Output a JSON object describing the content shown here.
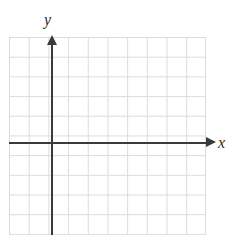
{
  "figure": {
    "type": "blank-coordinate-grid",
    "background_color": "#ffffff",
    "width": 231,
    "height": 235
  },
  "chart_data": {
    "type": "scatter",
    "title": "",
    "subtitle": "",
    "xlabel": "x",
    "ylabel": "y",
    "series": [],
    "x": [],
    "values": [],
    "annotations": [],
    "legend": [],
    "legend_position": "none",
    "grid": true,
    "grid_color": "#dcdcdc",
    "grid_cell_size_px": 19.7,
    "grid_columns": 10,
    "grid_rows": 10,
    "axis_color": "#3a3a3a",
    "xlim": [
      -2.2,
      7.8
    ],
    "ylim": [
      -4.7,
      5.3
    ],
    "xticklabels": [],
    "yticklabels": [],
    "origin_px": {
      "x": 52,
      "y": 143
    },
    "note": "Empty graph paper: axes drawn with arrowheads, no plotted data, no numeric tick labels."
  },
  "axes": {
    "x": {
      "label": "x",
      "arrow_icon": "arrow-right-icon"
    },
    "y": {
      "label": "y",
      "arrow_icon": "arrow-up-icon"
    }
  }
}
